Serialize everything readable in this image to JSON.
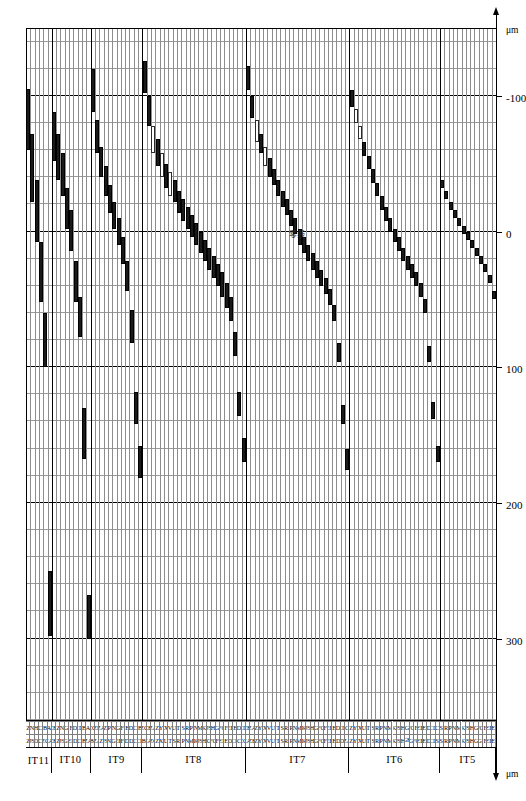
{
  "figure": {
    "type": "range_bar",
    "unit_label": "μm",
    "zero_line_note": "零线",
    "colors": {
      "fill_bar": "#1a1a1a",
      "hollow_bar": "#ffffff",
      "grid": "#8d8d8d",
      "axis": "#000000"
    }
  },
  "axis": {
    "label_left": "μm",
    "label_right": "μm",
    "ticks": [
      {
        "value": 300,
        "label": "300"
      },
      {
        "value": 200,
        "label": "200"
      },
      {
        "value": 100,
        "label": "100"
      },
      {
        "value": 0,
        "label": "0"
      },
      {
        "value": -100,
        "label": "-100"
      }
    ],
    "range": [
      360,
      -150
    ],
    "minor_step": 20,
    "major_step": 100
  },
  "chart_data": {
    "type": "bar",
    "xlabel": "μm",
    "ylabel": "",
    "xlim": [
      360,
      -150
    ],
    "grid": true,
    "legend": [
      {
        "name": "hole / shaft tolerance zone (filled)",
        "style": "filled"
      },
      {
        "name": "alternate tolerance zone (hollow)",
        "style": "hollow"
      }
    ],
    "groups": [
      {
        "name": "IT11",
        "rows": [
          {
            "a": "Z",
            "b": "Z",
            "lo": -105,
            "hi": -60,
            "style": "filled"
          },
          {
            "a": "JS",
            "b": "N",
            "lo": -72,
            "hi": -22,
            "style": "filled"
          },
          {
            "a": "D",
            "b": "H",
            "lo": -38,
            "hi": 8,
            "style": "filled"
          },
          {
            "a": "C",
            "b": "C",
            "lo": 8,
            "hi": 52,
            "style": "filled"
          },
          {
            "a": "ZC",
            "b": "B",
            "lo": 60,
            "hi": 100,
            "style": "filled"
          },
          {
            "a": "ZA",
            "b": "A",
            "lo": 250,
            "hi": 298,
            "style": "filled"
          }
        ]
      },
      {
        "name": "IT10",
        "rows": [
          {
            "a": "ZB",
            "b": "ZB",
            "lo": -88,
            "hi": -52,
            "style": "filled"
          },
          {
            "a": "Z",
            "b": "Z",
            "lo": -72,
            "hi": -38,
            "style": "filled"
          },
          {
            "a": "JS",
            "b": "N",
            "lo": -58,
            "hi": -26,
            "style": "filled"
          },
          {
            "a": "FGH",
            "b": "G",
            "lo": -32,
            "hi": -2,
            "style": "filled"
          },
          {
            "a": "EF",
            "b": "F",
            "lo": -16,
            "hi": 14,
            "style": "filled"
          },
          {
            "a": "CDE",
            "b": "D",
            "lo": 22,
            "hi": 52,
            "style": "filled"
          },
          {
            "a": "C",
            "b": "CD",
            "lo": 48,
            "hi": 78,
            "style": "filled"
          },
          {
            "a": "B",
            "b": "B",
            "lo": 130,
            "hi": 168,
            "style": "filled"
          },
          {
            "a": "ZA",
            "b": "A",
            "lo": 268,
            "hi": 300,
            "style": "filled"
          }
        ]
      },
      {
        "name": "IT9",
        "rows": [
          {
            "a": "ZBA",
            "b": "ZC",
            "lo": -120,
            "hi": -88,
            "style": "filled"
          },
          {
            "a": "ZA",
            "b": "ZB",
            "lo": -82,
            "hi": -58,
            "style": "filled"
          },
          {
            "a": "Z",
            "b": "ZA",
            "lo": -62,
            "hi": -40,
            "style": "filled"
          },
          {
            "a": "JS",
            "b": "Z",
            "lo": -48,
            "hi": -26,
            "style": "filled"
          },
          {
            "a": "N",
            "b": "P",
            "lo": -34,
            "hi": -14,
            "style": "filled"
          },
          {
            "a": "FGH",
            "b": "N",
            "lo": -22,
            "hi": -2,
            "style": "filled"
          },
          {
            "a": "EF",
            "b": "G",
            "lo": -10,
            "hi": 10,
            "style": "filled"
          },
          {
            "a": "F",
            "b": "F",
            "lo": 4,
            "hi": 24,
            "style": "filled"
          },
          {
            "a": "D",
            "b": "E",
            "lo": 22,
            "hi": 44,
            "style": "filled"
          },
          {
            "a": "CDE",
            "b": "D",
            "lo": 58,
            "hi": 82,
            "style": "filled"
          },
          {
            "a": "C",
            "b": "C",
            "lo": 118,
            "hi": 142,
            "style": "filled"
          },
          {
            "a": "CB",
            "b": "B",
            "lo": 158,
            "hi": 182,
            "style": "filled"
          }
        ]
      },
      {
        "name": "IT8",
        "rows": [
          {
            "a": "ZBA",
            "b": "ZC",
            "lo": -126,
            "hi": -102,
            "style": "filled"
          },
          {
            "a": "ZA",
            "b": "ZB",
            "lo": -100,
            "hi": -78,
            "style": "filled"
          },
          {
            "a": "ZC",
            "b": "ZA",
            "lo": -78,
            "hi": -58,
            "style": "hollow"
          },
          {
            "a": "Z",
            "b": "Z",
            "lo": -68,
            "hi": -48,
            "style": "filled"
          },
          {
            "a": "X",
            "b": "Y",
            "lo": -58,
            "hi": -40,
            "style": "hollow"
          },
          {
            "a": "U",
            "b": "X",
            "lo": -50,
            "hi": -32,
            "style": "filled"
          },
          {
            "a": "T",
            "b": "V",
            "lo": -44,
            "hi": -26,
            "style": "hollow"
          },
          {
            "a": "S",
            "b": "U",
            "lo": -38,
            "hi": -22,
            "style": "filled"
          },
          {
            "a": "R",
            "b": "T",
            "lo": -30,
            "hi": -14,
            "style": "filled"
          },
          {
            "a": "P",
            "b": "S",
            "lo": -24,
            "hi": -8,
            "style": "filled"
          },
          {
            "a": "N",
            "b": "R",
            "lo": -18,
            "hi": -2,
            "style": "filled"
          },
          {
            "a": "M",
            "b": "P",
            "lo": -12,
            "hi": 4,
            "style": "filled"
          },
          {
            "a": "K",
            "b": "N",
            "lo": -6,
            "hi": 10,
            "style": "filled"
          },
          {
            "a": "JS",
            "b": "M",
            "lo": 0,
            "hi": 16,
            "style": "filled"
          },
          {
            "a": "H",
            "b": "K",
            "lo": 6,
            "hi": 22,
            "style": "filled"
          },
          {
            "a": "G",
            "b": "JS",
            "lo": 12,
            "hi": 28,
            "style": "filled"
          },
          {
            "a": "FG",
            "b": "H",
            "lo": 18,
            "hi": 34,
            "style": "filled"
          },
          {
            "a": "F",
            "b": "G",
            "lo": 24,
            "hi": 40,
            "style": "filled"
          },
          {
            "a": "EF",
            "b": "FG",
            "lo": 30,
            "hi": 48,
            "style": "filled"
          },
          {
            "a": "E",
            "b": "F",
            "lo": 38,
            "hi": 56,
            "style": "filled"
          },
          {
            "a": "D",
            "b": "EF",
            "lo": 48,
            "hi": 66,
            "style": "filled"
          },
          {
            "a": "CD",
            "b": "E",
            "lo": 74,
            "hi": 92,
            "style": "filled"
          },
          {
            "a": "C",
            "b": "D",
            "lo": 118,
            "hi": 136,
            "style": "filled"
          },
          {
            "a": "ZC",
            "b": "CD",
            "lo": 152,
            "hi": 170,
            "style": "filled"
          }
        ]
      },
      {
        "name": "IT7",
        "rows": [
          {
            "a": "ZA",
            "b": "ZB",
            "lo": -122,
            "hi": -104,
            "style": "filled"
          },
          {
            "a": "ZB",
            "b": "ZA",
            "lo": -100,
            "hi": -84,
            "style": "filled"
          },
          {
            "a": "Z",
            "b": "Z",
            "lo": -82,
            "hi": -66,
            "style": "hollow"
          },
          {
            "a": "Y",
            "b": "Y",
            "lo": -72,
            "hi": -58,
            "style": "filled"
          },
          {
            "a": "X",
            "b": "X",
            "lo": -62,
            "hi": -48,
            "style": "hollow"
          },
          {
            "a": "V",
            "b": "V",
            "lo": -54,
            "hi": -40,
            "style": "filled"
          },
          {
            "a": "U",
            "b": "U",
            "lo": -46,
            "hi": -34,
            "style": "filled"
          },
          {
            "a": "T",
            "b": "T",
            "lo": -38,
            "hi": -26,
            "style": "filled"
          },
          {
            "a": "S",
            "b": "S",
            "lo": -30,
            "hi": -18,
            "style": "filled"
          },
          {
            "a": "R",
            "b": "R",
            "lo": -24,
            "hi": -12,
            "style": "filled"
          },
          {
            "a": "P",
            "b": "P",
            "lo": -16,
            "hi": -4,
            "style": "filled"
          },
          {
            "a": "N",
            "b": "N",
            "lo": -10,
            "hi": 2,
            "style": "filled"
          },
          {
            "a": "M",
            "b": "M",
            "lo": -2,
            "hi": 10,
            "style": "filled"
          },
          {
            "a": "K",
            "b": "K",
            "lo": 4,
            "hi": 16,
            "style": "filled"
          },
          {
            "a": "JS",
            "b": "JS",
            "lo": 10,
            "hi": 22,
            "style": "filled"
          },
          {
            "a": "H",
            "b": "H",
            "lo": 16,
            "hi": 28,
            "style": "filled"
          },
          {
            "a": "G",
            "b": "G",
            "lo": 22,
            "hi": 34,
            "style": "filled"
          },
          {
            "a": "FG",
            "b": "FG",
            "lo": 28,
            "hi": 40,
            "style": "filled"
          },
          {
            "a": "F",
            "b": "F",
            "lo": 34,
            "hi": 46,
            "style": "filled"
          },
          {
            "a": "EF",
            "b": "EF",
            "lo": 42,
            "hi": 54,
            "style": "filled"
          },
          {
            "a": "E",
            "b": "E",
            "lo": 54,
            "hi": 66,
            "style": "filled"
          },
          {
            "a": "CDE",
            "b": "D",
            "lo": 82,
            "hi": 96,
            "style": "filled"
          },
          {
            "a": "D",
            "b": "CD",
            "lo": 128,
            "hi": 142,
            "style": "filled"
          },
          {
            "a": "ZA",
            "b": "C",
            "lo": 160,
            "hi": 176,
            "style": "filled"
          }
        ]
      },
      {
        "name": "IT6",
        "rows": [
          {
            "a": "Z",
            "b": "Z",
            "lo": -104,
            "hi": -92,
            "style": "filled"
          },
          {
            "a": "Y",
            "b": "Y",
            "lo": -90,
            "hi": -80,
            "style": "hollow"
          },
          {
            "a": "X",
            "b": "X",
            "lo": -78,
            "hi": -68,
            "style": "hollow"
          },
          {
            "a": "U",
            "b": "U",
            "lo": -66,
            "hi": -56,
            "style": "filled"
          },
          {
            "a": "T",
            "b": "T",
            "lo": -56,
            "hi": -46,
            "style": "filled"
          },
          {
            "a": "S",
            "b": "S",
            "lo": -46,
            "hi": -36,
            "style": "filled"
          },
          {
            "a": "R",
            "b": "R",
            "lo": -36,
            "hi": -26,
            "style": "filled"
          },
          {
            "a": "P",
            "b": "P",
            "lo": -26,
            "hi": -16,
            "style": "filled"
          },
          {
            "a": "N",
            "b": "N",
            "lo": -18,
            "hi": -8,
            "style": "filled"
          },
          {
            "a": "M",
            "b": "M",
            "lo": -10,
            "hi": 0,
            "style": "filled"
          },
          {
            "a": "K",
            "b": "K",
            "lo": -2,
            "hi": 8,
            "style": "filled"
          },
          {
            "a": "JS",
            "b": "JS",
            "lo": 4,
            "hi": 14,
            "style": "filled"
          },
          {
            "a": "H",
            "b": "H",
            "lo": 12,
            "hi": 22,
            "style": "filled"
          },
          {
            "a": "GH",
            "b": "G",
            "lo": 18,
            "hi": 28,
            "style": "filled"
          },
          {
            "a": "G",
            "b": "FG",
            "lo": 24,
            "hi": 34,
            "style": "filled"
          },
          {
            "a": "FG",
            "b": "F",
            "lo": 30,
            "hi": 40,
            "style": "filled"
          },
          {
            "a": "EF",
            "b": "EF",
            "lo": 38,
            "hi": 48,
            "style": "filled"
          },
          {
            "a": "E",
            "b": "E",
            "lo": 50,
            "hi": 60,
            "style": "filled"
          },
          {
            "a": "D",
            "b": "D",
            "lo": 84,
            "hi": 96,
            "style": "filled"
          },
          {
            "a": "CD",
            "b": "CD",
            "lo": 126,
            "hi": 138,
            "style": "filled"
          },
          {
            "a": "S",
            "b": "C",
            "lo": 158,
            "hi": 170,
            "style": "filled"
          }
        ]
      },
      {
        "name": "IT5",
        "rows": [
          {
            "a": "S",
            "b": "S",
            "lo": -38,
            "hi": -32,
            "style": "filled"
          },
          {
            "a": "R",
            "b": "R",
            "lo": -30,
            "hi": -24,
            "style": "filled"
          },
          {
            "a": "P",
            "b": "P",
            "lo": -22,
            "hi": -16,
            "style": "filled"
          },
          {
            "a": "N",
            "b": "N",
            "lo": -16,
            "hi": -10,
            "style": "filled"
          },
          {
            "a": "M",
            "b": "M",
            "lo": -10,
            "hi": -4,
            "style": "filled"
          },
          {
            "a": "K",
            "b": "K",
            "lo": -4,
            "hi": 2,
            "style": "filled"
          },
          {
            "a": "JS",
            "b": "JS",
            "lo": 0,
            "hi": 6,
            "style": "filled"
          },
          {
            "a": "H",
            "b": "H",
            "lo": 6,
            "hi": 12,
            "style": "filled"
          },
          {
            "a": "G",
            "b": "G",
            "lo": 12,
            "hi": 18,
            "style": "filled"
          },
          {
            "a": "FGH",
            "b": "FG",
            "lo": 18,
            "hi": 24,
            "style": "filled"
          },
          {
            "a": "F",
            "b": "F",
            "lo": 24,
            "hi": 30,
            "style": "filled"
          },
          {
            "a": "EF",
            "b": "EF",
            "lo": 32,
            "hi": 38,
            "style": "filled"
          },
          {
            "a": "E",
            "b": "E",
            "lo": 44,
            "hi": 50,
            "style": "filled"
          }
        ]
      }
    ]
  }
}
